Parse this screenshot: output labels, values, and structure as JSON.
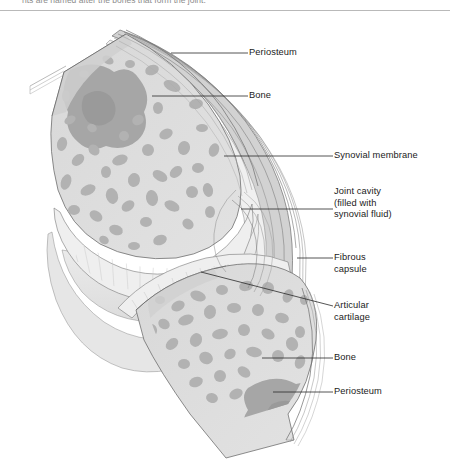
{
  "figure": {
    "name": "synovial-joint-cross-section",
    "caption_partial": "nts are named after the bones that form the joint.",
    "background": "#ffffff",
    "divider_color": "#b9b9b9"
  },
  "palette": {
    "bone_fill": "#dcdcdc",
    "bone_fill_light": "#e4e4e4",
    "trabecula": "#b2b2b2",
    "trabecula_dark": "#9b9b9b",
    "marrow_dark": "#a3a3a3",
    "capsule_fiber": "#c9c9c9",
    "capsule_line": "#6f6f6f",
    "cartilage": "#ededed",
    "cavity": "#e9e9e9",
    "outline": "#5a5a5a",
    "leader_line": "#2a2a2a",
    "label_text": "#1b1b1b"
  },
  "labels": [
    {
      "id": "periosteum-top",
      "text": "Periosteum",
      "x": 249,
      "y": 47,
      "leader": {
        "x1": 248,
        "y1": 53,
        "x2": 171,
        "y2": 53
      }
    },
    {
      "id": "bone-top",
      "text": "Bone",
      "x": 249,
      "y": 90,
      "leader": {
        "x1": 248,
        "y1": 96,
        "x2": 152,
        "y2": 96
      }
    },
    {
      "id": "synovial-membrane",
      "text": "Synovial membrane",
      "x": 334,
      "y": 150,
      "leader": {
        "x1": 333,
        "y1": 156,
        "x2": 224,
        "y2": 156
      }
    },
    {
      "id": "joint-cavity",
      "text": "Joint cavity\n(filled with\nsynovial fluid)",
      "x": 334,
      "y": 186,
      "leader": {
        "x1": 333,
        "y1": 209,
        "x2": 241,
        "y2": 209
      }
    },
    {
      "id": "fibrous-capsule",
      "text": "Fibrous\ncapsule",
      "x": 334,
      "y": 252,
      "leader": {
        "x1": 333,
        "y1": 258,
        "x2": 297,
        "y2": 258
      }
    },
    {
      "id": "articular-cartilage",
      "text": "Articular\ncartilage",
      "x": 334,
      "y": 300,
      "leader": {
        "x1": 333,
        "y1": 306,
        "x2": 201,
        "y2": 272
      }
    },
    {
      "id": "bone-bottom",
      "text": "Bone",
      "x": 334,
      "y": 352,
      "leader": {
        "x1": 333,
        "y1": 358,
        "x2": 262,
        "y2": 358
      }
    },
    {
      "id": "periosteum-bottom",
      "text": "Periosteum",
      "x": 334,
      "y": 386,
      "leader": {
        "x1": 333,
        "y1": 392,
        "x2": 273,
        "y2": 392
      }
    }
  ],
  "structures": [
    {
      "id": "upper-bone",
      "name": "upper-bone-epiphysis"
    },
    {
      "id": "lower-bone",
      "name": "lower-bone-epiphysis"
    },
    {
      "id": "joint-cavity-space",
      "name": "joint-cavity"
    },
    {
      "id": "articular-cartilage-upper",
      "name": "articular-cartilage-upper"
    },
    {
      "id": "articular-cartilage-lower",
      "name": "articular-cartilage-lower"
    },
    {
      "id": "fibrous-capsule-layer",
      "name": "fibrous-capsule"
    },
    {
      "id": "synovial-membrane-layer",
      "name": "synovial-membrane"
    },
    {
      "id": "periosteum-upper",
      "name": "periosteum-upper"
    },
    {
      "id": "periosteum-lower",
      "name": "periosteum-lower"
    }
  ]
}
